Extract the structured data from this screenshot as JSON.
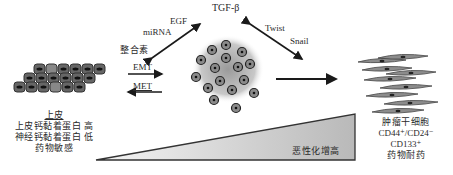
{
  "diagram": {
    "top": {
      "tgf_label": "TGF-β",
      "egf_label": "EGF",
      "mirna_label": "miRNA",
      "integrin_label": "整合素",
      "twist_label": "Twist",
      "snail_label": "Snail"
    },
    "transitions": {
      "emt_label": "EMT",
      "met_label": "MET"
    },
    "epithelial": {
      "title": "上皮",
      "line1": "上皮钙黏着蛋白  高",
      "line2": "神经钙黏着蛋白  低",
      "line3": "药物敏感"
    },
    "stem_cells": {
      "title": "肿瘤干细胞",
      "line1": "CD44⁺/CD24⁻",
      "line2": "CD133⁺",
      "line3": "药物耐药"
    },
    "gradient": {
      "label": "恶性化增高"
    },
    "colors": {
      "arrow": "#1a1a1a",
      "cell_fill": "#6b6b6b",
      "cell_dark": "#3a3a3a",
      "triangle_light": "#f2f2f2",
      "triangle_dark": "#bdbdbd"
    }
  }
}
